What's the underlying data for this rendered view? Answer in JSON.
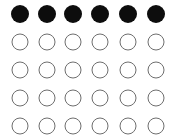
{
  "figure": {
    "name": "circle-grid",
    "canvas": {
      "width": 178,
      "height": 140,
      "background_color": "#ffffff"
    },
    "columns": 6,
    "rows": 5,
    "column_centers_x": [
      20,
      47,
      73,
      100,
      128,
      156
    ],
    "row_centers_y": [
      14,
      42,
      70,
      98,
      126
    ],
    "styles": {
      "filled": {
        "fill_color": "#0d0d0d",
        "stroke_color": "#0d0d0d",
        "stroke_width": 0,
        "diameter": 18
      },
      "open": {
        "fill_color": "#ffffff",
        "stroke_color": "#6e6e6e",
        "stroke_width": 1.2,
        "diameter": 17
      }
    },
    "cells": [
      [
        {
          "state": "filled"
        },
        {
          "state": "filled"
        },
        {
          "state": "filled"
        },
        {
          "state": "filled"
        },
        {
          "state": "filled"
        },
        {
          "state": "filled"
        }
      ],
      [
        {
          "state": "open"
        },
        {
          "state": "open"
        },
        {
          "state": "open"
        },
        {
          "state": "open"
        },
        {
          "state": "open"
        },
        {
          "state": "open"
        }
      ],
      [
        {
          "state": "open"
        },
        {
          "state": "open"
        },
        {
          "state": "open"
        },
        {
          "state": "open"
        },
        {
          "state": "open"
        },
        {
          "state": "open"
        }
      ],
      [
        {
          "state": "open"
        },
        {
          "state": "open"
        },
        {
          "state": "open"
        },
        {
          "state": "open"
        },
        {
          "state": "open"
        },
        {
          "state": "open"
        }
      ],
      [
        {
          "state": "open"
        },
        {
          "state": "open"
        },
        {
          "state": "open"
        },
        {
          "state": "open"
        },
        {
          "state": "open"
        },
        {
          "state": "open"
        }
      ]
    ]
  }
}
